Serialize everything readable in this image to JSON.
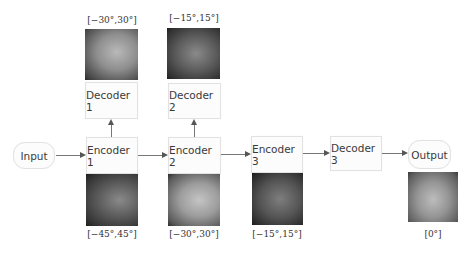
{
  "diagram": {
    "nodes": {
      "input": {
        "label": "Input"
      },
      "encoder1": {
        "label": "Encoder 1"
      },
      "encoder2": {
        "label": "Encoder 2"
      },
      "encoder3": {
        "label": "Encoder 3"
      },
      "decoder1": {
        "label": "Decoder 1"
      },
      "decoder2": {
        "label": "Decoder 2"
      },
      "decoder3": {
        "label": "Decoder 3"
      },
      "output": {
        "label": "Output"
      }
    },
    "angle_labels": {
      "decoder1_top": "[−30°,30°]",
      "decoder2_top": "[−15°,15°]",
      "encoder1_bottom": "[−45°,45°]",
      "encoder2_bottom": "[−30°,30°]",
      "encoder3_bottom": "[−15°,15°]",
      "output_bottom": "[0°]"
    },
    "edges": [
      [
        "Input",
        "Encoder 1"
      ],
      [
        "Encoder 1",
        "Encoder 2"
      ],
      [
        "Encoder 2",
        "Encoder 3"
      ],
      [
        "Encoder 3",
        "Decoder 3"
      ],
      [
        "Decoder 3",
        "Output"
      ],
      [
        "Encoder 1",
        "Decoder 1"
      ],
      [
        "Encoder 2",
        "Decoder 2"
      ]
    ],
    "colors": {
      "box_border": "#e2e2e2",
      "box_fill": "#fcfcfc",
      "arrow": "#555555",
      "text": "#3a3a3a"
    }
  }
}
